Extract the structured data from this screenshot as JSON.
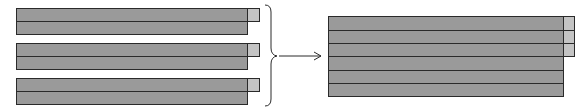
{
  "diagram": {
    "colors": {
      "bar_fill": "#9a9a9a",
      "square_fill": "#c4c4c4",
      "stroke": "#2a2a2a"
    },
    "left_groups": [
      {
        "rows": 2,
        "has_square_on_top_row": true
      },
      {
        "rows": 2,
        "has_square_on_top_row": true
      },
      {
        "rows": 2,
        "has_square_on_top_row": true
      }
    ],
    "connector": {
      "brace": "right-curly-brace",
      "arrow": "right-arrow"
    },
    "merged_block": {
      "rows": 6,
      "squares_on_rows": [
        1,
        2,
        3
      ]
    }
  }
}
